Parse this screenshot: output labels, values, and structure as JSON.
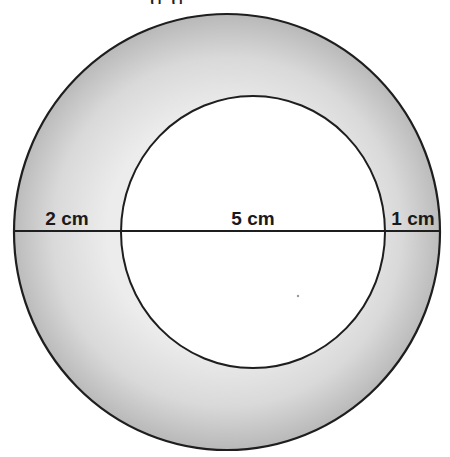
{
  "diagram": {
    "title_fragment": "g         g",
    "shape": "annulus",
    "outer_circle": {
      "cx": 227,
      "cy": 232,
      "rx": 213,
      "ry": 218,
      "stroke": "#1e1e1e"
    },
    "inner_circle": {
      "cx": 253,
      "cy": 232,
      "rx": 132,
      "ry": 136,
      "fill": "#ffffff",
      "stroke": "#1e1e1e"
    },
    "ring_shading": {
      "edge": "#b8b8b8",
      "inner": "#ececec"
    },
    "diameter_line": {
      "y": 231,
      "x1": 14,
      "x2": 439
    },
    "labels": [
      {
        "id": "left-gap",
        "text": "2 cm",
        "x": 67,
        "y": 208
      },
      {
        "id": "inner-diameter",
        "text": "5 cm",
        "x": 253,
        "y": 208
      },
      {
        "id": "right-gap",
        "text": "1 cm",
        "x": 413,
        "y": 208
      }
    ]
  }
}
